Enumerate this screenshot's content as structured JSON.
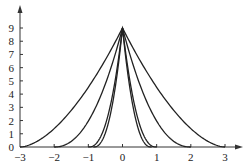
{
  "chart_data": {
    "type": "line",
    "title": "",
    "xlabel": "",
    "ylabel": "",
    "xlim": [
      -3,
      3
    ],
    "ylim": [
      0,
      9
    ],
    "x_ticks": [
      "-3",
      "-2",
      "-1",
      "0",
      "1",
      "2",
      "3"
    ],
    "y_ticks": [
      "0",
      "1",
      "2",
      "3",
      "4",
      "5",
      "6",
      "7",
      "8",
      "9"
    ],
    "grid": false,
    "legend": "none",
    "series": [
      {
        "name": "curve-support-3",
        "peak": [
          0,
          9
        ],
        "x_zero": [
          -3,
          3
        ],
        "x": [
          -3,
          -2,
          -1,
          -0.5,
          0,
          0.5,
          1,
          2,
          3
        ],
        "y": [
          0,
          1.2,
          4.2,
          6.4,
          9,
          6.4,
          4.2,
          1.2,
          0
        ]
      },
      {
        "name": "curve-support-2",
        "peak": [
          0,
          9
        ],
        "x_zero": [
          -2,
          2
        ],
        "x": [
          -2,
          -1.5,
          -1,
          -0.5,
          0,
          0.5,
          1,
          1.5,
          2
        ],
        "y": [
          0,
          0.4,
          1.8,
          4.8,
          9,
          4.8,
          1.8,
          0.4,
          0
        ]
      },
      {
        "name": "curve-support-1",
        "peak": [
          0,
          9
        ],
        "x_zero": [
          -1,
          1
        ],
        "x": [
          -1,
          -0.75,
          -0.5,
          -0.25,
          0,
          0.25,
          0.5,
          0.75,
          1
        ],
        "y": [
          0,
          0.4,
          1.6,
          4.6,
          9,
          4.6,
          1.6,
          0.4,
          0
        ]
      },
      {
        "name": "curve-support-0.8",
        "peak": [
          0,
          9
        ],
        "x_zero": [
          -0.85,
          0.85
        ],
        "x": [
          -0.85,
          -0.6,
          -0.4,
          -0.2,
          0,
          0.2,
          0.4,
          0.6,
          0.85
        ],
        "y": [
          0,
          0.5,
          1.8,
          4.8,
          9,
          4.8,
          1.8,
          0.5,
          0
        ]
      }
    ]
  },
  "axes": {
    "x_tick_labels": [
      "−3",
      "−2",
      "−1",
      "0",
      "1",
      "2",
      "3"
    ],
    "y_tick_labels": [
      "0",
      "1",
      "2",
      "3",
      "4",
      "5",
      "6",
      "7",
      "8",
      "9"
    ]
  }
}
